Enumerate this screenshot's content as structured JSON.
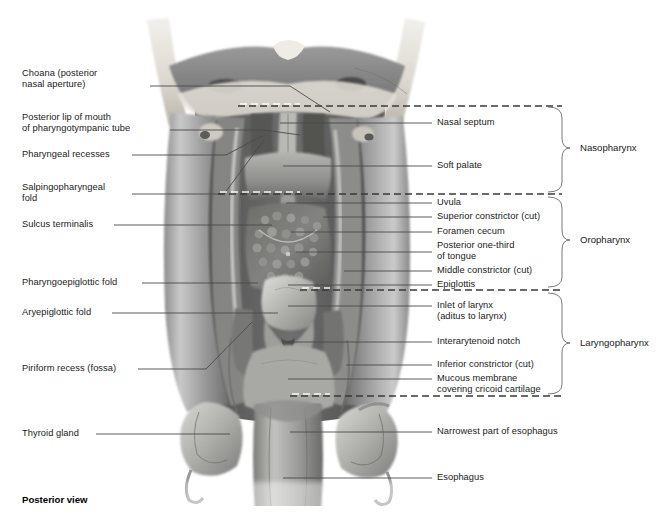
{
  "figure": {
    "caption": "Posterior view",
    "view_type": "posterior"
  },
  "labels_left": [
    {
      "id": "choana",
      "text": "Choana (posterior\nnasal aperture)",
      "x": 22,
      "y": 74,
      "line_from_x": 149,
      "line_from_y": 86,
      "line_to_x": 290,
      "line_to_y": 86,
      "elbow_x": 330,
      "elbow_y": 112
    },
    {
      "id": "posterior-lip-pharyngotympanic-tube",
      "text": "Posterior lip of mouth\nof pharyngotympanic tube",
      "x": 22,
      "y": 118,
      "line_from_x": 168,
      "line_from_y": 130,
      "line_to_x": 268,
      "line_to_y": 130,
      "elbow_x": 300,
      "elbow_y": 134
    },
    {
      "id": "pharyngeal-recesses",
      "text": "Pharyngeal recesses",
      "x": 22,
      "y": 150,
      "line_from_x": 130,
      "line_from_y": 155,
      "line_to_x": 228,
      "line_to_y": 155,
      "elbow_x": 262,
      "elbow_y": 134
    },
    {
      "id": "salpingopharyngeal-fold",
      "text": "Salpingopharyngeal\nfold",
      "x": 22,
      "y": 182,
      "line_from_x": 128,
      "line_from_y": 194,
      "line_to_x": 226,
      "line_to_y": 194,
      "elbow_x": 262,
      "elbow_y": 138
    },
    {
      "id": "sulcus-terminalis",
      "text": "Sulcus terminalis",
      "x": 22,
      "y": 220,
      "line_from_x": 113,
      "line_from_y": 225,
      "line_to_x": 272,
      "line_to_y": 225,
      "elbow_x": 272,
      "elbow_y": 225
    },
    {
      "id": "pharyngoepiglottic-fold",
      "text": "Pharyngoepiglottic fold",
      "x": 22,
      "y": 278,
      "line_from_x": 140,
      "line_from_y": 283,
      "line_to_x": 258,
      "line_to_y": 283,
      "elbow_x": 258,
      "elbow_y": 283
    },
    {
      "id": "aryepiglottic-fold",
      "text": "Aryepiglottic fold",
      "x": 22,
      "y": 308,
      "line_from_x": 110,
      "line_from_y": 313,
      "line_to_x": 276,
      "line_to_y": 313,
      "elbow_x": 276,
      "elbow_y": 313
    },
    {
      "id": "piriform-recess",
      "text": "Piriform recess (fossa)",
      "x": 22,
      "y": 364,
      "line_from_x": 136,
      "line_from_y": 369,
      "line_to_x": 206,
      "line_to_y": 369,
      "elbow_x": 252,
      "elbow_y": 322
    },
    {
      "id": "thyroid-gland",
      "text": "Thyroid gland",
      "x": 22,
      "y": 429,
      "line_from_x": 94,
      "line_from_y": 434,
      "line_to_x": 228,
      "line_to_y": 434,
      "elbow_x": 228,
      "elbow_y": 434
    }
  ],
  "labels_right": [
    {
      "id": "nasal-septum",
      "text": "Nasal septum",
      "x": 437,
      "y": 118,
      "dash_x": 424,
      "dash_y": 123,
      "line_to_x": 280,
      "line_to_y": 123
    },
    {
      "id": "soft-palate",
      "text": "Soft palate",
      "x": 437,
      "y": 161,
      "dash_x": 424,
      "dash_y": 166,
      "line_to_x": 283,
      "line_to_y": 166
    },
    {
      "id": "uvula",
      "text": "Uvula",
      "x": 437,
      "y": 198,
      "dash_x": 424,
      "dash_y": 203,
      "line_to_x": 286,
      "line_to_y": 203
    },
    {
      "id": "superior-constrictor-cut",
      "text": "Superior constrictor (cut)",
      "x": 437,
      "y": 212,
      "dash_x": 424,
      "dash_y": 217,
      "line_to_x": 323,
      "line_to_y": 217
    },
    {
      "id": "foramen-cecum",
      "text": "Foramen cecum",
      "x": 437,
      "y": 227,
      "dash_x": 424,
      "dash_y": 232,
      "line_to_x": 291,
      "line_to_y": 232
    },
    {
      "id": "posterior-one-third-of-tongue",
      "text": "Posterior one-third\nof tongue",
      "x": 437,
      "y": 241,
      "dash_x": 424,
      "dash_y": 252,
      "line_to_x": 296,
      "line_to_y": 252
    },
    {
      "id": "middle-constrictor-cut",
      "text": "Middle constrictor (cut)",
      "x": 437,
      "y": 266,
      "dash_x": 424,
      "dash_y": 271,
      "line_to_x": 344,
      "line_to_y": 271
    },
    {
      "id": "epiglottis",
      "text": "Epiglottis",
      "x": 437,
      "y": 280,
      "dash_x": 424,
      "dash_y": 285,
      "line_to_x": 288,
      "line_to_y": 285
    },
    {
      "id": "inlet-of-larynx",
      "text": "Inlet of larynx\n(aditus to larynx)",
      "x": 437,
      "y": 301,
      "dash_x": 424,
      "dash_y": 306,
      "line_to_x": 288,
      "line_to_y": 306
    },
    {
      "id": "interarytenoid-notch",
      "text": "Interarytenoid notch",
      "x": 437,
      "y": 337,
      "dash_x": 424,
      "dash_y": 342,
      "line_to_x": 287,
      "line_to_y": 342
    },
    {
      "id": "inferior-constrictor-cut",
      "text": "Inferior constrictor (cut)",
      "x": 437,
      "y": 360,
      "dash_x": 424,
      "dash_y": 365,
      "line_to_x": 346,
      "line_to_y": 365
    },
    {
      "id": "mucous-membrane-cricoid",
      "text": "Mucous membrane\ncovering cricoid cartilage",
      "x": 437,
      "y": 374,
      "dash_x": 424,
      "dash_y": 379,
      "line_to_x": 288,
      "line_to_y": 379
    },
    {
      "id": "narrowest-part-of-esophagus",
      "text": "Narrowest part of esophagus",
      "x": 437,
      "y": 427,
      "dash_x": 424,
      "dash_y": 432,
      "line_to_x": 290,
      "line_to_y": 432
    },
    {
      "id": "esophagus",
      "text": "Esophagus",
      "x": 437,
      "y": 473,
      "dash_x": 424,
      "dash_y": 478,
      "line_to_x": 283,
      "line_to_y": 478
    }
  ],
  "regions": [
    {
      "id": "nasopharynx",
      "label": "Nasopharynx",
      "label_x": 580,
      "label_y": 148,
      "bracket_top": 106,
      "bracket_bottom": 193,
      "bracket_x": 562,
      "dash_y_top": 106,
      "dash_y_bottom": 193
    },
    {
      "id": "oropharynx",
      "label": "Oropharynx",
      "label_x": 580,
      "label_y": 240,
      "bracket_top": 196,
      "bracket_bottom": 289,
      "bracket_x": 562,
      "dash_y_top": 196,
      "dash_y_bottom": 289
    },
    {
      "id": "laryngopharynx",
      "label": "Laryngopharynx",
      "label_x": 580,
      "label_y": 343,
      "bracket_top": 292,
      "bracket_bottom": 396,
      "bracket_x": 562,
      "dash_y_top": 292,
      "dash_y_bottom": 396
    }
  ],
  "boundary_dashes": [
    {
      "id": "skullbase-nasopharynx-boundary",
      "y": 106,
      "x_start": 238,
      "x_end": 562
    },
    {
      "id": "nasopharynx-oropharynx-boundary",
      "y": 194,
      "x_start": 218,
      "x_end": 562
    },
    {
      "id": "oropharynx-laryngopharynx-boundary",
      "y": 290,
      "x_start": 300,
      "x_end": 562
    },
    {
      "id": "laryngopharynx-esophagus-boundary",
      "y": 396,
      "x_start": 290,
      "x_end": 562
    }
  ],
  "colors": {
    "line": "#4a4a4a",
    "text": "#1a1a1a",
    "bracket": "#6a6a6a",
    "background": "#ffffff"
  }
}
